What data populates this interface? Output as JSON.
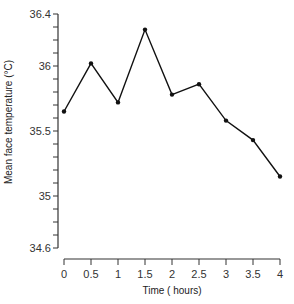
{
  "chart_data": {
    "type": "line",
    "title": "",
    "xlabel": "Time ( hours)",
    "ylabel": "Mean face temperature (°C)",
    "x": [
      0,
      0.5,
      1,
      1.5,
      2,
      2.5,
      3,
      3.5,
      4
    ],
    "series": [
      {
        "name": "Mean face temperature",
        "values": [
          35.65,
          36.02,
          35.72,
          36.28,
          35.78,
          35.86,
          35.58,
          35.43,
          35.15
        ],
        "marker": "circle",
        "color": "#111111"
      }
    ],
    "xlim": [
      0,
      4
    ],
    "ylim": [
      34.6,
      36.4
    ],
    "xticks": [
      0,
      0.5,
      1,
      1.5,
      2,
      2.5,
      3,
      3.5,
      4
    ],
    "xtick_labels": [
      "0",
      "0.5",
      "1",
      "1.5",
      "2",
      "2.5",
      "3",
      "3.5",
      "4"
    ],
    "yticks_major": [
      34.6,
      35,
      35.5,
      36,
      36.4
    ],
    "ytick_labels": [
      "34.6",
      "35",
      "35.5",
      "36",
      "36.4"
    ],
    "ytick_minor_step": 0.1,
    "grid": false,
    "legend": null
  }
}
